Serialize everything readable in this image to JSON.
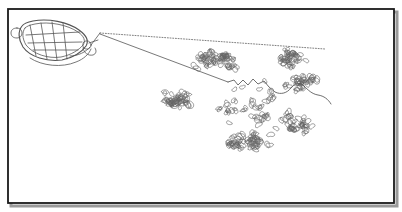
{
  "figure": {
    "caption": "",
    "title": "",
    "type": "line-drawing",
    "background_color": "#ffffff",
    "ink_color": "#555555",
    "frame": {
      "label": "image-frame",
      "color": "#1a1a1a",
      "shadow_color": "#9a9a9a",
      "x": 8,
      "y": 9,
      "width": 386,
      "height": 194,
      "stroke_width": 1.8
    },
    "boat": {
      "label": "boat",
      "color": "#555555",
      "stroke_width": 0.8,
      "hull_outline": "M 22 26 C 18 31 18 39 23 47 C 30 57 47 62 62 60 C 73 58 82 52 86 46 C 89 41 86 35 79 30 C 68 22 48 18 33 21 C 28 22 24 23 22 26 Z",
      "gunwale_inner": "M 25 28 C 22 32 22 38 26 45 C 33 54 48 59 61 57 C 71 55 79 50 83 45 C 86 41 84 36 78 32 C 68 25 49 21 35 24 C 30 25 27 26 25 28 Z",
      "bow_knob": "M 17 28 C 13 28 11 30 11 33 C 11 36 13 38 17 38 C 20 38 22 36 22 33 C 22 30 20 28 17 28 Z",
      "thwarts": [
        "M 30 25 L 36 56",
        "M 41 23 L 47 59",
        "M 52 22 L 57 60",
        "M 63 23 L 67 59",
        "M 26 35 L 80 32",
        "M 28 43 L 82 42",
        "M 33 50 L 78 50"
      ],
      "stern_curve": "M 70 56 C 78 56 86 52 90 47",
      "wake_curve": "M 30 58 C 42 66 62 68 76 62 C 84 59 89 54 91 49",
      "operator": {
        "label": "boat-operator",
        "head": {
          "cx": 87,
          "cy": 45,
          "r": 4.1
        },
        "body": "M 83 48 C 84 53 88 56 93 55 C 96 54 97 51 95 48",
        "arm": "M 89 43 L 98 40"
      }
    },
    "tow_lines": {
      "label": "tow-lines",
      "apex_x": 100,
      "apex_y": 33,
      "upper_dotted": {
        "label": "upper-tow-line-dotted",
        "path": "M 100 33 L 325 49",
        "dash": "1 1.7",
        "stroke_width": 0.75
      },
      "lower_solid": {
        "label": "lower-tow-line-solid",
        "path": "M 100 34 L 228 82",
        "dash": "none",
        "stroke_width": 0.8
      },
      "bridle": {
        "label": "bridle-to-stern",
        "path": "M 100 33 L 91 45"
      }
    },
    "boom_line": {
      "label": "floating-boom-line",
      "stroke_width": 0.85,
      "path": "M 228 82 L 234 80 L 238 85 L 243 80 L 248 85 L 253 79 L 258 84 L 264 81 L 269 87 L 275 92 C 281 95 287 93 291 88 C 295 83 300 82 304 86 C 308 90 312 94 318 95 C 324 96 328 99 331 104"
    },
    "plants": {
      "label": "water-hyacinth-plants",
      "description": "floating rosettes drawn as small paired kidney/heart-shaped leaf outlines",
      "count": 168,
      "color": "#666666",
      "stroke_width": 0.65,
      "clusters": [
        {
          "label": "upper-mat",
          "cx": 218,
          "cy": 60,
          "rx": 48,
          "ry": 22,
          "density": "high"
        },
        {
          "label": "upper-right-mat",
          "cx": 290,
          "cy": 58,
          "rx": 36,
          "ry": 18,
          "density": "medium"
        },
        {
          "label": "right-mat",
          "cx": 300,
          "cy": 82,
          "rx": 34,
          "ry": 18,
          "density": "medium"
        },
        {
          "label": "mid-left-mat",
          "cx": 178,
          "cy": 100,
          "rx": 34,
          "ry": 22,
          "density": "high"
        },
        {
          "label": "lower-center-mat",
          "cx": 245,
          "cy": 140,
          "rx": 52,
          "ry": 24,
          "density": "high"
        },
        {
          "label": "lower-right-mat",
          "cx": 300,
          "cy": 125,
          "rx": 34,
          "ry": 20,
          "density": "medium"
        },
        {
          "label": "scatter-field",
          "cx": 250,
          "cy": 110,
          "rx": 95,
          "ry": 55,
          "density": "low"
        }
      ],
      "seed": 20240518
    }
  }
}
